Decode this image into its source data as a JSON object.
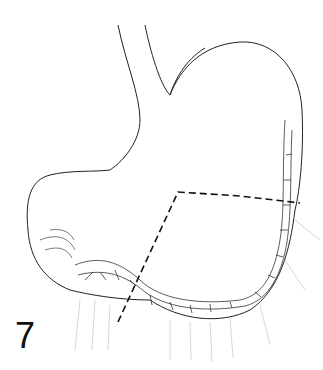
{
  "figure": {
    "number": "7",
    "line_color": "#222222",
    "background": "#ffffff",
    "dashed_resection_line": {
      "points": [
        [
          118,
          322
        ],
        [
          178,
          192
        ],
        [
          240,
          196
        ],
        [
          300,
          203
        ]
      ]
    }
  }
}
